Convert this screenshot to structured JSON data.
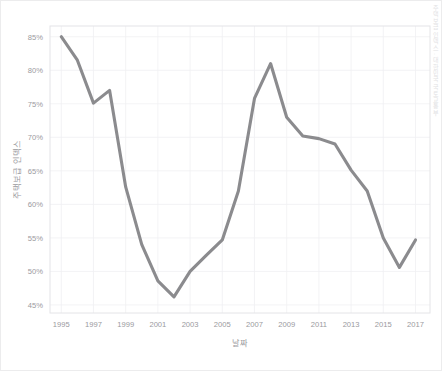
{
  "figure": {
    "background_color": "#ffffff",
    "border_color": "#ececed",
    "watermark_text": "주택보급 인덱스 · 대한민국 국토교통부"
  },
  "chart_data": {
    "type": "line",
    "title": "",
    "subtitle": "",
    "xlabel": "날짜",
    "ylabel": "주택보급 인덱스",
    "xlim": [
      1994.3,
      2017.9
    ],
    "ylim": [
      43.8,
      86.6
    ],
    "grid": true,
    "legend": "none",
    "line_color": "#8b8b8e",
    "x_tick_labels": [
      "1995",
      "1997",
      "1999",
      "2001",
      "2003",
      "2005",
      "2007",
      "2009",
      "2011",
      "2013",
      "2015",
      "2017"
    ],
    "x_ticks": [
      1995,
      1997,
      1999,
      2001,
      2003,
      2005,
      2007,
      2009,
      2011,
      2013,
      2015,
      2017
    ],
    "y_tick_labels": [
      "45%",
      "50%",
      "55%",
      "60%",
      "65%",
      "70%",
      "75%",
      "80%",
      "85%"
    ],
    "y_ticks": [
      45,
      50,
      55,
      60,
      65,
      70,
      75,
      80,
      85
    ],
    "series": [
      {
        "name": "주택보급 인덱스",
        "x": [
          1995,
          1996,
          1997,
          1998,
          1999,
          2000,
          2001,
          2002,
          2003,
          2004,
          2005,
          2006,
          2007,
          2008,
          2009,
          2010,
          2011,
          2012,
          2013,
          2014,
          2015,
          2016,
          2017
        ],
        "values": [
          85.0,
          81.5,
          75.1,
          77.0,
          62.6,
          54.0,
          48.6,
          46.2,
          50.0,
          52.4,
          54.7,
          62.0,
          75.8,
          81.0,
          73.0,
          70.2,
          69.8,
          69.0,
          65.1,
          62.0,
          55.0,
          50.6,
          54.7
        ]
      }
    ]
  }
}
